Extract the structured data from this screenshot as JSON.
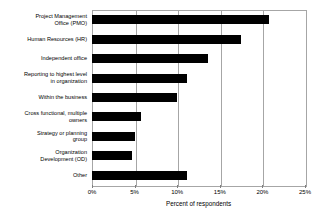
{
  "chart_data": {
    "type": "bar",
    "orientation": "horizontal",
    "title": "",
    "xlabel": "Percent of respondents",
    "ylabel": "",
    "xlim": [
      0,
      25
    ],
    "xtick_labels": [
      "0%",
      "5%",
      "10%",
      "15%",
      "20%",
      "25%"
    ],
    "xticks": [
      0,
      5,
      10,
      15,
      20,
      25
    ],
    "grid": true,
    "legend": false,
    "bar_color": "#000000",
    "categories": [
      "Project Management Office (PMO)",
      "Human Resources (HR)",
      "Independent office",
      "Reporting to highest level in organization",
      "Within the business",
      "Cross functional, multiple owners",
      "Strategy or planning group",
      "Organization Development (OD)",
      "Other"
    ],
    "category_lines": [
      [
        "Project Management",
        "Office (PMO)"
      ],
      [
        "Human Resources (HR)"
      ],
      [
        "Independent office"
      ],
      [
        "Reporting to highest level",
        "in organization"
      ],
      [
        "Within the business"
      ],
      [
        "Cross functional, multiple",
        "owners"
      ],
      [
        "Strategy or planning",
        "group"
      ],
      [
        "Organization",
        "Development (OD)"
      ],
      [
        "Other"
      ]
    ],
    "values": [
      20.8,
      17.5,
      13.6,
      11.2,
      10.0,
      5.7,
      5.0,
      4.7,
      11.2
    ]
  }
}
